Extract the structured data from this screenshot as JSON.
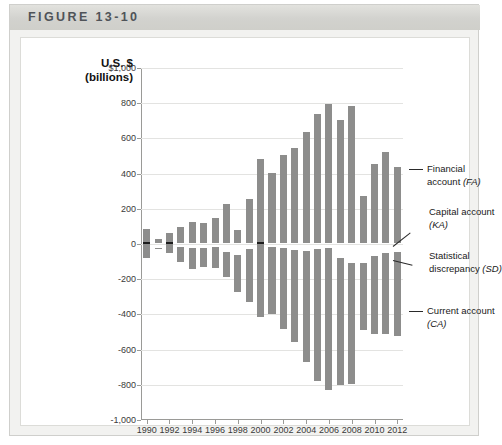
{
  "figure": {
    "label": "FIGURE 13-10"
  },
  "axis": {
    "title_line1": "U.S. $",
    "title_line2": "(billions)",
    "y_ticks": [
      "$1,000",
      "800",
      "600",
      "400",
      "200",
      "0",
      "-200",
      "-400",
      "-600",
      "-800",
      "-1,000"
    ],
    "y_values": [
      1000,
      800,
      600,
      400,
      200,
      0,
      -200,
      -400,
      -600,
      -800,
      -1000
    ],
    "x_ticks": [
      "1990",
      "1992",
      "1994",
      "1996",
      "1998",
      "2000",
      "2002",
      "2004",
      "2006",
      "2008",
      "2010",
      "2012"
    ]
  },
  "callouts": [
    {
      "line1": "Financial",
      "line2": "account (FA)",
      "abbr": "FA"
    },
    {
      "line1": "Capital account",
      "line2": "(KA)",
      "abbr": "KA"
    },
    {
      "line1": "Statistical",
      "line2": "discrepancy (SD)",
      "abbr": "SD"
    },
    {
      "line1": "Current account",
      "line2": "(CA)",
      "abbr": "CA"
    }
  ],
  "colors": {
    "financial_account": "#8d8d8c",
    "current_account": "#8d8d8c",
    "capital_account": "#d9d9d6",
    "statistical_discrepancy": "#d9d9d6",
    "statistical_discrepancy_dark": "#1d1d1d",
    "banner": "#d2d2ce",
    "card": "#f2f2f0",
    "grid": "#e3e3e1",
    "axis": "#9a9a97"
  },
  "chart_data": {
    "type": "bar",
    "title": "FIGURE 13-10",
    "subtype": "stacked-diverging",
    "xlabel": "",
    "ylabel": "U.S. $ (billions)",
    "ylim": [
      -1000,
      1000
    ],
    "ytick_step": 200,
    "grid": true,
    "legend": "annotated-callouts",
    "categories": [
      1990,
      1991,
      1992,
      1993,
      1994,
      1995,
      1996,
      1997,
      1998,
      1999,
      2000,
      2001,
      2002,
      2003,
      2004,
      2005,
      2006,
      2007,
      2008,
      2009,
      2010,
      2011,
      2012
    ],
    "series": [
      {
        "name": "Financial account (FA)",
        "key": "FA",
        "values": [
          75,
          20,
          60,
          90,
          120,
          115,
          145,
          225,
          75,
          250,
          480,
          400,
          500,
          540,
          630,
          735,
          790,
          700,
          780,
          270,
          450,
          520,
          430
        ]
      },
      {
        "name": "Capital account (KA)",
        "key": "KA",
        "values": [
          10,
          6,
          5,
          5,
          5,
          5,
          5,
          5,
          5,
          5,
          5,
          5,
          5,
          5,
          5,
          5,
          5,
          5,
          5,
          5,
          5,
          5,
          5
        ]
      },
      {
        "name": "Statistical discrepancy (SD)",
        "key": "SD",
        "values": [
          -25,
          25,
          -25,
          15,
          20,
          25,
          15,
          45,
          60,
          30,
          -65,
          15,
          25,
          35,
          40,
          30,
          20,
          80,
          110,
          110,
          70,
          50,
          45
        ]
      },
      {
        "name": "Current account (CA)",
        "key": "CA",
        "values": [
          -79,
          -3,
          -50,
          -85,
          -122,
          -106,
          -121,
          -141,
          -215,
          -301,
          -417,
          -385,
          -459,
          -522,
          -631,
          -749,
          -807,
          -719,
          -687,
          -381,
          -443,
          -459,
          -475
        ]
      }
    ]
  }
}
